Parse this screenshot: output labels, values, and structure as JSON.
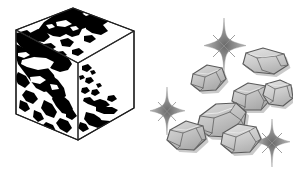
{
  "scene": {
    "title": "World map cube and gemstone cluster illustration",
    "width": 293,
    "height": 172,
    "background_color": "#ffffff",
    "style": "black and white line art with grayscale shading"
  },
  "cube": {
    "label": "world-map-cube",
    "description": "Isometric cube with world map continents rendered as solid black landmasses wrapping across the top and left faces",
    "outline_color": "#2a2a2a",
    "landmass_color": "#000000",
    "ocean_color": "#ffffff",
    "faces": [
      {
        "name": "top",
        "label": "Top face",
        "shade": "#ffffff"
      },
      {
        "name": "left",
        "label": "Left face",
        "shade": "#ffffff"
      },
      {
        "name": "right",
        "label": "Right face",
        "shade": "#ffffff"
      }
    ]
  },
  "gems": {
    "label": "gemstone-cluster",
    "description": "Cluster of seven faceted gray rock gemstones with drop shadows",
    "count": 7,
    "fill_color": "#bdbdbd",
    "highlight_color": "#d8d8d8",
    "outline_color": "#5a5a5a",
    "shadow_color": "#9a9a9a",
    "items": [
      {
        "name": "gem-top-right",
        "label": "Gem 1"
      },
      {
        "name": "gem-upper-left",
        "label": "Gem 2"
      },
      {
        "name": "gem-mid-right",
        "label": "Gem 3"
      },
      {
        "name": "gem-right-edge",
        "label": "Gem 4"
      },
      {
        "name": "gem-center",
        "label": "Gem 5"
      },
      {
        "name": "gem-lower-left",
        "label": "Gem 6"
      },
      {
        "name": "gem-bottom",
        "label": "Gem 7"
      }
    ]
  },
  "sparkles": {
    "label": "sparkle-stars",
    "description": "Four-pointed sparkle stars scattered around the gemstones",
    "color": "#8c8c8c",
    "count": 3,
    "items": [
      {
        "name": "sparkle-top",
        "label": "Sparkle 1"
      },
      {
        "name": "sparkle-left",
        "label": "Sparkle 2"
      },
      {
        "name": "sparkle-bottom-right",
        "label": "Sparkle 3"
      }
    ]
  }
}
